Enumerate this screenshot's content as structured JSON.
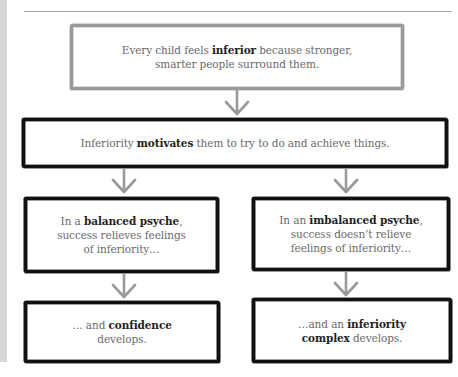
{
  "diagram": {
    "type": "flowchart",
    "colors": {
      "background": "#ffffff",
      "side_strip": "#d8d8d8",
      "rule_line": "#a8a8a8",
      "top_box_border": "#9a9a9a",
      "box_border": "#111111",
      "arrow": "#9a9a9a",
      "text_regular": "#6a6a6a",
      "text_bold": "#1e1e1e"
    },
    "nodes": [
      {
        "id": "node-1",
        "segments": [
          {
            "text": "Every child feels ",
            "bold": false
          },
          {
            "text": "inferior",
            "bold": true
          },
          {
            "text": " because stronger, smarter people surround them.",
            "bold": false
          }
        ],
        "line1_pre": "Every child feels ",
        "line1_bold": "inferior",
        "line1_post": " because stronger,",
        "line2": "smarter people surround them."
      },
      {
        "id": "node-2",
        "pre": "Inferiority ",
        "bold": "motivates",
        "post": " them to try to do and achieve things."
      },
      {
        "id": "node-3",
        "line1_pre": "In a ",
        "line1_bold": "balanced psyche",
        "line1_post": ",",
        "line2": "success relieves feelings",
        "line3": "of inferiority…"
      },
      {
        "id": "node-4",
        "line1_pre": "In an ",
        "line1_bold": "imbalanced psyche",
        "line1_post": ",",
        "line2": "success doesn’t relieve",
        "line3": "feelings of inferiority…"
      },
      {
        "id": "node-5",
        "line1_pre": "… and ",
        "line1_bold": "confidence",
        "line2": "develops."
      },
      {
        "id": "node-6",
        "line1_pre": "…and an ",
        "line1_bold": "inferiority",
        "line2_bold": "complex",
        "line2_post": " develops."
      }
    ],
    "edges": [
      {
        "from": "node-1",
        "to": "node-2",
        "icon": "down-arrow-icon"
      },
      {
        "from": "node-2",
        "to": "node-3",
        "icon": "down-arrow-icon"
      },
      {
        "from": "node-2",
        "to": "node-4",
        "icon": "down-arrow-icon"
      },
      {
        "from": "node-3",
        "to": "node-5",
        "icon": "down-arrow-icon"
      },
      {
        "from": "node-4",
        "to": "node-6",
        "icon": "down-arrow-icon"
      }
    ]
  }
}
